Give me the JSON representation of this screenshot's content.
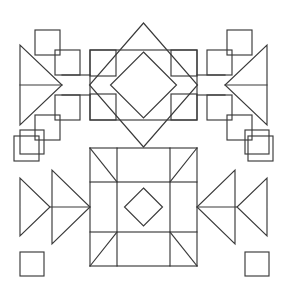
{
  "canvas": {
    "width": 287,
    "height": 289,
    "background": "#ffffff",
    "stroke_color": "#3a3a3a",
    "stroke_width": 1.15,
    "fill": "none",
    "description": "Two black-and-white line-art geometric patterns stacked vertically on a white page, each bilaterally symmetric about a vertical center axis."
  },
  "figures": [
    {
      "id": "top-figure",
      "name": "staircase-square-and-diamond-rosette",
      "bounds": {
        "x": 14,
        "y": 24,
        "width": 259,
        "height": 120
      },
      "center_x": 143.5,
      "axis_y": 85,
      "elements": {
        "center_square": {
          "x": 90,
          "y": 50,
          "width": 107,
          "height": 70
        },
        "outer_diamond": {
          "cx": 143.5,
          "cy": 85,
          "rx": 54,
          "ry": 62
        },
        "inner_diamond": {
          "cx": 143.5,
          "cy": 85,
          "rx": 33,
          "ry": 33
        },
        "corner_squares": [
          {
            "x": 90,
            "y": 50,
            "size": 26,
            "corner": "top-left"
          },
          {
            "x": 171,
            "y": 50,
            "size": 26,
            "corner": "top-right"
          },
          {
            "x": 90,
            "y": 94,
            "size": 26,
            "corner": "bottom-left"
          },
          {
            "x": 171,
            "y": 94,
            "size": 26,
            "corner": "bottom-right"
          }
        ],
        "left_triangle": {
          "apex_x": 62,
          "apex_y": 85,
          "back_x": 20,
          "top_y": 45,
          "bottom_y": 125,
          "points_toward": "right"
        },
        "right_triangle": {
          "apex_x": 225,
          "apex_y": 85,
          "back_x": 267,
          "top_y": 45,
          "bottom_y": 125,
          "points_toward": "left"
        },
        "left_staircase_squares": [
          {
            "x": 35,
            "y": 30,
            "size": 25
          },
          {
            "x": 55,
            "y": 50,
            "size": 25
          },
          {
            "x": 55,
            "y": 95,
            "size": 25
          },
          {
            "x": 35,
            "y": 115,
            "size": 25
          },
          {
            "x": 14,
            "y": 136,
            "size": 25
          }
        ],
        "right_staircase_squares": [
          {
            "x": 227,
            "y": 30,
            "size": 25
          },
          {
            "x": 207,
            "y": 50,
            "size": 25
          },
          {
            "x": 207,
            "y": 95,
            "size": 25
          },
          {
            "x": 227,
            "y": 115,
            "size": 25
          },
          {
            "x": 248,
            "y": 136,
            "size": 25
          }
        ],
        "connector_bars": [
          {
            "from_x": 62,
            "to_x": 90,
            "y_top": 75,
            "y_bottom": 95,
            "side": "left"
          },
          {
            "from_x": 197,
            "to_x": 225,
            "y_top": 75,
            "y_bottom": 95,
            "side": "right"
          }
        ]
      }
    },
    {
      "id": "bottom-figure",
      "name": "pinwheel-grid-with-nested-triangles",
      "bounds": {
        "x": 20,
        "y": 130,
        "width": 247,
        "height": 147
      },
      "center_x": 143.5,
      "axis_y": 207,
      "elements": {
        "grid": {
          "x_lines": [
            117,
            170
          ],
          "y_lines": [
            182,
            232
          ],
          "outer_x": [
            90,
            197
          ],
          "outer_y": [
            148,
            266
          ]
        },
        "center_diamond": {
          "cx": 143.5,
          "cy": 207,
          "rx": 19,
          "ry": 19
        },
        "corner_triangles": 4,
        "vertical_bars": [
          {
            "x": 117,
            "y": 148,
            "width": 53,
            "height": 118
          }
        ],
        "horizontal_bar": {
          "x": 90,
          "y": 182,
          "width": 107,
          "height": 50
        },
        "left_triangle_outer": {
          "apex_x": 90,
          "apex_y": 207,
          "back_x": 52,
          "top_y": 170,
          "bottom_y": 244,
          "points_toward": "right"
        },
        "left_triangle_inner": {
          "apex_x": 50,
          "apex_y": 207,
          "back_x": 20,
          "top_y": 178,
          "bottom_y": 236,
          "points_toward": "right"
        },
        "right_triangle_outer": {
          "apex_x": 197,
          "apex_y": 207,
          "back_x": 235,
          "top_y": 170,
          "bottom_y": 244,
          "points_toward": "left"
        },
        "right_triangle_inner": {
          "apex_x": 237,
          "apex_y": 207,
          "back_x": 267,
          "top_y": 178,
          "bottom_y": 236,
          "points_toward": "left"
        },
        "corner_squares": [
          {
            "x": 20,
            "y": 130,
            "size": 24,
            "corner": "top-left"
          },
          {
            "x": 245,
            "y": 130,
            "size": 24,
            "corner": "top-right"
          },
          {
            "x": 20,
            "y": 252,
            "size": 24,
            "corner": "bottom-left"
          },
          {
            "x": 245,
            "y": 252,
            "size": 24,
            "corner": "bottom-right"
          }
        ]
      }
    }
  ]
}
